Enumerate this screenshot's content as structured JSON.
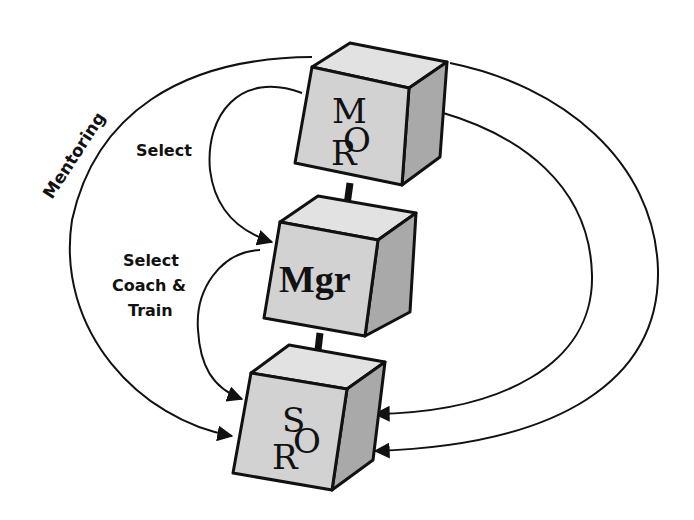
{
  "diagram": {
    "colors": {
      "background": "#ffffff",
      "stroke": "#111111",
      "cube_front": "#d2d2d2",
      "cube_top": "#e2e2e2",
      "cube_side": "#a9a9a9"
    },
    "nodes": [
      {
        "id": "top",
        "letters": {
          "a": "M",
          "b": "O",
          "c": "R"
        }
      },
      {
        "id": "middle",
        "label": "Mgr"
      },
      {
        "id": "bottom",
        "letters": {
          "a": "S",
          "b": "O",
          "c": "R"
        }
      }
    ],
    "labels": {
      "mentoring": "Mentoring",
      "select": "Select",
      "select_coach_train": [
        "Select",
        "Coach &",
        "Train"
      ]
    },
    "edges": [
      {
        "from": "top",
        "to": "middle",
        "label": "Select"
      },
      {
        "from": "middle",
        "to": "bottom",
        "label": "Select Coach & Train"
      },
      {
        "from": "top",
        "to": "bottom",
        "label": "Mentoring"
      },
      {
        "from": "top",
        "to": "bottom",
        "label": ""
      },
      {
        "from": "top",
        "to": "bottom",
        "label": ""
      }
    ]
  }
}
